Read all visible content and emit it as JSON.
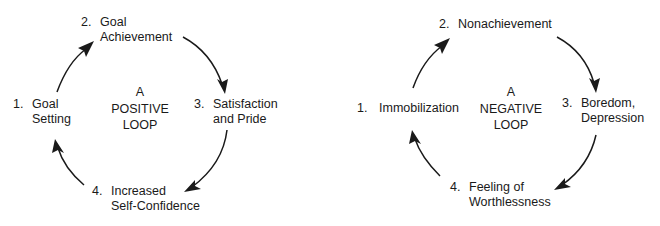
{
  "diagrams": [
    {
      "title_lines": [
        "A",
        "POSITIVE",
        "LOOP"
      ],
      "steps": [
        {
          "number": "1.",
          "lines": [
            "Goal",
            "Setting"
          ]
        },
        {
          "number": "2.",
          "lines": [
            "Goal",
            "Achievement"
          ]
        },
        {
          "number": "3.",
          "lines": [
            "Satisfaction",
            "and Pride"
          ]
        },
        {
          "number": "4.",
          "lines": [
            "Increased",
            "Self-Confidence"
          ]
        }
      ],
      "flow": [
        "1 -> 2",
        "2 -> 3",
        "3 -> 4",
        "4 -> 1"
      ]
    },
    {
      "title_lines": [
        "A",
        "NEGATIVE",
        "LOOP"
      ],
      "steps": [
        {
          "number": "1.",
          "lines": [
            "Immobilization"
          ]
        },
        {
          "number": "2.",
          "lines": [
            "Nonachievement"
          ]
        },
        {
          "number": "3.",
          "lines": [
            "Boredom,",
            "Depression"
          ]
        },
        {
          "number": "4.",
          "lines": [
            "Feeling of",
            "Worthlessness"
          ]
        }
      ],
      "flow": [
        "1 -> 2",
        "2 -> 3",
        "3 -> 4",
        "4 -> 1"
      ]
    }
  ],
  "colors": {
    "ink": "#1a1a1a",
    "background": "#ffffff"
  }
}
